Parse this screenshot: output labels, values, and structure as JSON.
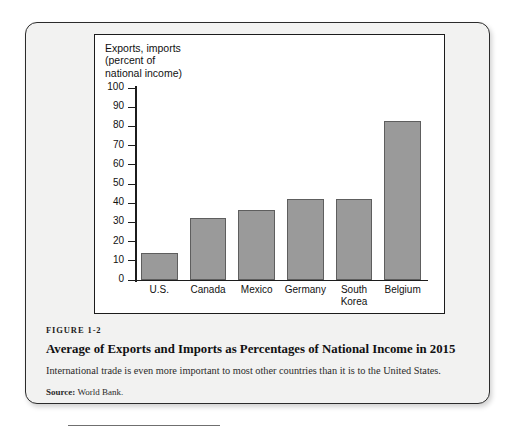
{
  "figure": {
    "number": "FIGURE 1-2",
    "title": "Average of Exports and Imports as Percentages of National Income in 2015",
    "description": "International trade is even more important to most other countries than it is to the United States.",
    "source_label": "Source:",
    "source_text": "World Bank."
  },
  "chart_data": {
    "type": "bar",
    "title": "",
    "axis_title": "Exports, imports\n(percent of\nnational income)",
    "xlabel": "",
    "ylabel": "Exports, imports (percent of national income)",
    "categories": [
      "U.S.",
      "Canada",
      "Mexico",
      "Germany",
      "South\nKorea",
      "Belgium"
    ],
    "values": [
      14,
      32.5,
      36.5,
      42,
      42,
      83
    ],
    "ylim": [
      0,
      100
    ],
    "yticks": [
      0,
      10,
      20,
      30,
      40,
      50,
      60,
      70,
      80,
      90,
      100
    ],
    "ytick_labels": [
      "0",
      "10",
      "20",
      "30",
      "40",
      "50",
      "60",
      "70",
      "80",
      "90",
      "100"
    ],
    "grid": false,
    "legend": "none",
    "bar_color": "#9a9a9a",
    "bar_border_color": "#5e5e5e"
  }
}
